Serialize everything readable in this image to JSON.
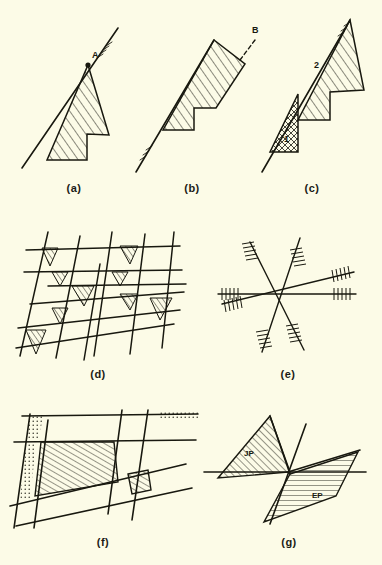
{
  "figure": {
    "background_color": "#fcfbe7",
    "ink_color": "#18180f",
    "width": 382,
    "height": 565,
    "panel_count": 7
  },
  "panels": [
    {
      "id": "a",
      "caption": "(a)",
      "description": "single hatched stepped polygon against a long diagonal trace",
      "labels": [
        {
          "text": "A",
          "kind": "point-label",
          "marker": "filled-dot"
        }
      ]
    },
    {
      "id": "b",
      "caption": "(b)",
      "description": "wider hatched stepped polygon with dashed leader line",
      "labels": [
        {
          "text": "B",
          "kind": "point-label",
          "marker": "dashed-leader"
        }
      ]
    },
    {
      "id": "c",
      "caption": "(c)",
      "description": "hatched wedge subdivided into numbered domains",
      "labels": [
        {
          "text": "1",
          "kind": "region-label",
          "pattern": "cross-hatch"
        },
        {
          "text": "2",
          "kind": "region-label",
          "pattern": "diagonal-hatch"
        }
      ]
    },
    {
      "id": "d",
      "caption": "(d)",
      "description": "grid of steep and gently inclined traces with small hatched intersection patches",
      "labels": []
    },
    {
      "id": "e",
      "caption": "(e)",
      "description": "radial star of lines with tick hatching on each arm end",
      "labels": []
    },
    {
      "id": "f",
      "caption": "(f)",
      "description": "grid with large hatched trapezoid block and small hatched block at right",
      "labels": []
    },
    {
      "id": "g",
      "caption": "(g)",
      "description": "crossing traces with two hatched wedges labelled JP and EP",
      "labels": [
        {
          "text": "JP",
          "kind": "region-label",
          "pattern": "diagonal-hatch"
        },
        {
          "text": "EP",
          "kind": "region-label",
          "pattern": "horizontal-hatch"
        }
      ]
    }
  ],
  "captions": {
    "a": "(a)",
    "b": "(b)",
    "c": "(c)",
    "d": "(d)",
    "e": "(e)",
    "f": "(f)",
    "g": "(g)"
  },
  "annotations": {
    "a_point": "A",
    "b_point": "B",
    "c_region_1": "1",
    "c_region_2": "2",
    "g_region_jp": "JP",
    "g_region_ep": "EP"
  }
}
